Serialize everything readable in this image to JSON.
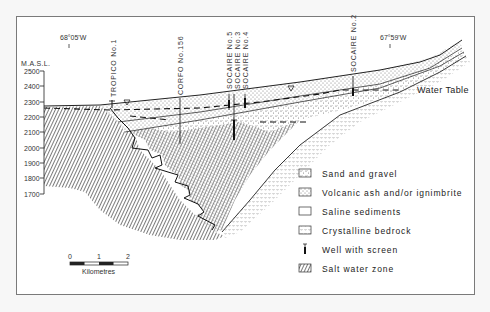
{
  "figure": {
    "type": "geological cross-section",
    "y_axis": {
      "label": "M.A.S.L.",
      "ticks": [
        "2500",
        "2400",
        "2300",
        "2200",
        "2100",
        "2000",
        "1900",
        "1800",
        "1700"
      ]
    },
    "coordinates": {
      "west": "68°05'W",
      "east": "67°59'W"
    },
    "wells": [
      {
        "id": "tropico-1",
        "label": "TROPICO No.1"
      },
      {
        "id": "corfo-156",
        "label": "CORFO No.156"
      },
      {
        "id": "socaire-5",
        "label": "SOCAIRE No.5"
      },
      {
        "id": "socaire-3",
        "label": "SOCAIRE No.3"
      },
      {
        "id": "socaire-4",
        "label": "SOCAIRE No.4"
      },
      {
        "id": "socaire-2",
        "label": "SOCAIRE No.2"
      }
    ],
    "water_table_label": "Water Table",
    "scale_bar": {
      "ticks": [
        "0",
        "1",
        "2"
      ],
      "unit": "Kilometres"
    },
    "legend": [
      {
        "id": "sand-gravel",
        "label": "Sand and gravel"
      },
      {
        "id": "volcanic-ash",
        "label": "Volcanic ash and/or ignimbrite"
      },
      {
        "id": "saline-sediments",
        "label": "Saline sediments"
      },
      {
        "id": "crystalline-bedrock",
        "label": "Crystalline bedrock"
      },
      {
        "id": "well-screen",
        "label": "Well with screen"
      },
      {
        "id": "salt-water",
        "label": "Salt water zone"
      }
    ]
  }
}
